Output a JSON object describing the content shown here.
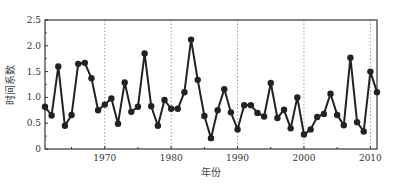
{
  "chart_data": {
    "type": "line",
    "title": "",
    "xlabel": "年份",
    "ylabel": "时间系数",
    "xlim": [
      1961,
      2011
    ],
    "ylim": [
      0,
      2.5
    ],
    "xticks": [
      1970,
      1980,
      1990,
      2000,
      2010
    ],
    "xtick_labels": [
      "1970",
      "1980",
      "1990",
      "2000",
      "2010"
    ],
    "yticks": [
      0,
      0.5,
      1.0,
      1.5,
      2.0,
      2.5
    ],
    "ytick_labels": [
      "0",
      "0.5",
      "1.0",
      "1.5",
      "2.0",
      "2.5"
    ],
    "grid": "vertical dotted lines at decades",
    "legend": "none",
    "series": [
      {
        "name": "时间系数",
        "marker": "filled circle",
        "color": "#222222",
        "x": [
          1961,
          1962,
          1963,
          1964,
          1965,
          1966,
          1967,
          1968,
          1969,
          1970,
          1971,
          1972,
          1973,
          1974,
          1975,
          1976,
          1977,
          1978,
          1979,
          1980,
          1981,
          1982,
          1983,
          1984,
          1985,
          1986,
          1987,
          1988,
          1989,
          1990,
          1991,
          1992,
          1993,
          1994,
          1995,
          1996,
          1997,
          1998,
          1999,
          2000,
          2001,
          2002,
          2003,
          2004,
          2005,
          2006,
          2007,
          2008,
          2009,
          2010,
          2011
        ],
        "values": [
          0.82,
          0.65,
          1.6,
          0.45,
          0.66,
          1.65,
          1.67,
          1.37,
          0.75,
          0.86,
          0.98,
          0.49,
          1.29,
          0.72,
          0.82,
          1.85,
          0.83,
          0.45,
          0.95,
          0.78,
          0.78,
          1.1,
          2.12,
          1.34,
          0.64,
          0.21,
          0.75,
          1.16,
          0.71,
          0.38,
          0.85,
          0.85,
          0.7,
          0.63,
          1.28,
          0.6,
          0.76,
          0.4,
          1.0,
          0.28,
          0.38,
          0.62,
          0.68,
          1.07,
          0.66,
          0.46,
          1.77,
          0.52,
          0.34,
          1.5,
          1.1
        ]
      }
    ]
  }
}
